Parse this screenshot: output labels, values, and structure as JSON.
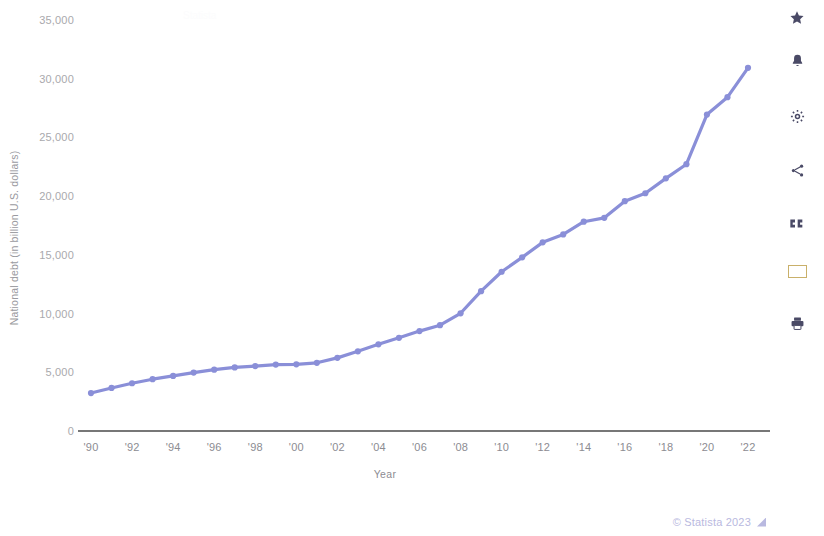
{
  "chart_data": {
    "type": "line",
    "title": "",
    "xlabel": "Year",
    "ylabel": "National debt (in billion U.S. dollars)",
    "xlim": [
      1990,
      2022
    ],
    "ylim": [
      0,
      35000
    ],
    "grid": false,
    "legend": "none",
    "series_color": "#8a8fd8",
    "x_tick_labels": [
      "'90",
      "'92",
      "'94",
      "'96",
      "'98",
      "'00",
      "'02",
      "'04",
      "'06",
      "'08",
      "'10",
      "'12",
      "'14",
      "'16",
      "'18",
      "'20",
      "'22"
    ],
    "x_tick_values": [
      1990,
      1992,
      1994,
      1996,
      1998,
      2000,
      2002,
      2004,
      2006,
      2008,
      2010,
      2012,
      2014,
      2016,
      2018,
      2020,
      2022
    ],
    "y_tick_labels": [
      "0",
      "5,000",
      "10,000",
      "15,000",
      "20,000",
      "25,000",
      "30,000",
      "35,000"
    ],
    "y_tick_values": [
      0,
      5000,
      10000,
      15000,
      20000,
      25000,
      30000,
      35000
    ],
    "x": [
      1990,
      1991,
      1992,
      1993,
      1994,
      1995,
      1996,
      1997,
      1998,
      1999,
      2000,
      2001,
      2002,
      2003,
      2004,
      2005,
      2006,
      2007,
      2008,
      2009,
      2010,
      2011,
      2012,
      2013,
      2014,
      2015,
      2016,
      2017,
      2018,
      2019,
      2020,
      2021,
      2022
    ],
    "values": [
      3233,
      3665,
      4065,
      4411,
      4693,
      4974,
      5225,
      5413,
      5526,
      5656,
      5674,
      5807,
      6228,
      6783,
      7379,
      7933,
      8507,
      9008,
      10025,
      11910,
      13562,
      14790,
      16066,
      16738,
      17824,
      18151,
      19573,
      20245,
      21516,
      22719,
      26945,
      28429,
      30928
    ],
    "series": [
      {
        "name": "National debt",
        "values": [
          3233,
          3665,
          4065,
          4411,
          4693,
          4974,
          5225,
          5413,
          5526,
          5656,
          5674,
          5807,
          6228,
          6783,
          7379,
          7933,
          8507,
          9008,
          10025,
          11910,
          13562,
          14790,
          16066,
          16738,
          17824,
          18151,
          19573,
          20245,
          21516,
          22719,
          26945,
          28429,
          30928
        ]
      }
    ]
  },
  "sidebar": {
    "items": [
      {
        "name": "favorite-star-icon",
        "label": "Add to favorites"
      },
      {
        "name": "notification-bell-icon",
        "label": "Notifications"
      },
      {
        "name": "gear-icon",
        "label": "Settings"
      },
      {
        "name": "share-icon",
        "label": "Share"
      },
      {
        "name": "quote-icon",
        "label": "Cite"
      },
      {
        "name": "spanish-flag-icon",
        "label": "Spanish"
      },
      {
        "name": "print-icon",
        "label": "Print"
      }
    ],
    "icon_color": "#4a4a66"
  },
  "footer": {
    "copyright": "© Statista 2023"
  },
  "watermarks": {
    "top_left": "Statista",
    "top_mid": "",
    "top_right": ""
  }
}
